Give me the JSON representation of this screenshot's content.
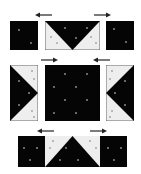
{
  "diagram": {
    "colors": {
      "dark": "#050505",
      "light": "#eeeeee",
      "border": "#666666",
      "arrow": "#222222",
      "dot": "#8a8a8a"
    },
    "rows": [
      {
        "name": "top-row",
        "pieces": [
          "dark-square",
          "flying-geese-down",
          "dark-square"
        ],
        "arrows": [
          "left",
          "right"
        ]
      },
      {
        "name": "middle-row",
        "pieces": [
          "half-square-left",
          "dark-center-square",
          "half-square-right"
        ],
        "arrows": [
          "right",
          "left"
        ]
      },
      {
        "name": "bottom-row",
        "pieces": [
          "joined-strip"
        ],
        "arrows": [
          "left",
          "right"
        ]
      }
    ]
  }
}
